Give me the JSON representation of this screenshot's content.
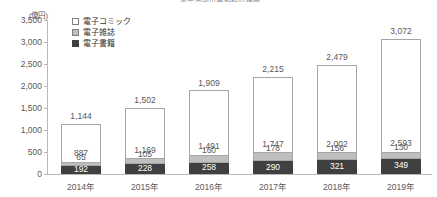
{
  "cropped_title": "電子出版市場規模の推移",
  "axis_unit": "(億円)",
  "legend": {
    "items": [
      {
        "label": "電子コミック",
        "color": "#ffffff",
        "key": "comic"
      },
      {
        "label": "電子雑誌",
        "color": "#bfbfbf",
        "key": "magazine"
      },
      {
        "label": "電子書籍",
        "color": "#404040",
        "key": "book"
      }
    ]
  },
  "yticks": [
    "3,500",
    "3,000",
    "2,500",
    "2,000",
    "1,500",
    "1,000",
    "500",
    "0"
  ],
  "chart_data": {
    "type": "bar",
    "subtype": "stacked",
    "title": "電子出版市場規模の推移",
    "xlabel": "",
    "ylabel": "(億円)",
    "ylim": [
      0,
      3500
    ],
    "ytick_step": 500,
    "grid": false,
    "legend_position": "top-left-inside",
    "categories": [
      "2014年",
      "2015年",
      "2016年",
      "2017年",
      "2018年",
      "2019年"
    ],
    "series": [
      {
        "name": "電子書籍",
        "color": "#404040",
        "values": [
          192,
          228,
          258,
          290,
          321,
          349
        ]
      },
      {
        "name": "電子雑誌",
        "color": "#bfbfbf",
        "values": [
          65,
          105,
          160,
          178,
          156,
          130
        ]
      },
      {
        "name": "電子コミック",
        "color": "#ffffff",
        "values": [
          887,
          1169,
          1491,
          1747,
          2002,
          2593
        ]
      }
    ],
    "totals": [
      1144,
      1502,
      1909,
      2215,
      2479,
      3072
    ],
    "total_labels": [
      "1,144",
      "1,502",
      "1,909",
      "2,215",
      "2,479",
      "3,072"
    ],
    "labels": {
      "book": [
        "192",
        "228",
        "258",
        "290",
        "321",
        "349"
      ],
      "magazine": [
        "65",
        "105",
        "160",
        "178",
        "156",
        "130"
      ],
      "comic": [
        "887",
        "1,169",
        "1,491",
        "1,747",
        "2,002",
        "2,593"
      ]
    }
  }
}
